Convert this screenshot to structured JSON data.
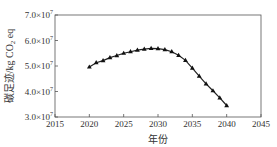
{
  "chart_data": {
    "type": "line",
    "title": "",
    "xlabel": "年份",
    "ylabel": "碳足迹/kg CO2-eq",
    "ylabel_parts": {
      "main": "碳足迹/kg CO",
      "sub": "2",
      "tail": " eq"
    },
    "x_ticks": [
      "2015",
      "2020",
      "2025",
      "2030",
      "2035",
      "2040",
      "2045"
    ],
    "y_ticks": [
      {
        "mant": "3.0×10",
        "exp": "7",
        "value": 30000000
      },
      {
        "mant": "4.0×10",
        "exp": "7",
        "value": 40000000
      },
      {
        "mant": "5.0×10",
        "exp": "7",
        "value": 50000000
      },
      {
        "mant": "6.0×10",
        "exp": "7",
        "value": 60000000
      },
      {
        "mant": "7.0×10",
        "exp": "7",
        "value": 70000000
      }
    ],
    "xlim": [
      2015,
      2045
    ],
    "ylim": [
      30000000,
      70000000
    ],
    "grid": false,
    "legend": null,
    "marker": "triangle",
    "series": [
      {
        "name": "碳足迹",
        "x": [
          2020,
          2021,
          2022,
          2023,
          2024,
          2025,
          2026,
          2027,
          2028,
          2029,
          2030,
          2031,
          2032,
          2033,
          2034,
          2035,
          2036,
          2037,
          2038,
          2039,
          2040
        ],
        "values": [
          49600000,
          51300000,
          52100000,
          53300000,
          54100000,
          55000000,
          55600000,
          56200000,
          56600000,
          56900000,
          56800000,
          56400000,
          55600000,
          54200000,
          52200000,
          49200000,
          46000000,
          43000000,
          40300000,
          37500000,
          34500000
        ]
      }
    ]
  }
}
